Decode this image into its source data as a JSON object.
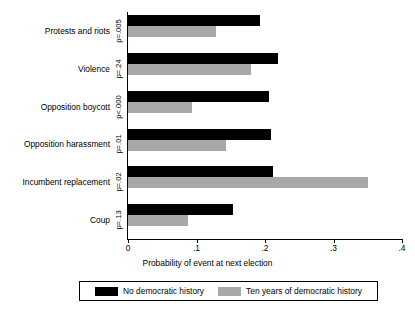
{
  "chart_data": {
    "type": "bar",
    "orientation": "horizontal",
    "title": "",
    "xlabel": "Probability of event at next election",
    "ylabel": "",
    "xlim": [
      0,
      0.4
    ],
    "xticks": [
      "0",
      ".1",
      ".2",
      ".3",
      ".4"
    ],
    "xtick_values": [
      0,
      0.1,
      0.2,
      0.3,
      0.4
    ],
    "grid": false,
    "legend_position": "bottom",
    "categories": [
      "Protests and riots",
      "Violence",
      "Opposition boycott",
      "Opposition harassment",
      "Incumbent replacement",
      "Coup"
    ],
    "annotations": [
      "p=.005",
      "p=.24",
      "p<.000",
      "p=.01",
      "p=.02",
      "p=.13"
    ],
    "series": [
      {
        "name": "No democratic history",
        "color": "#000000",
        "values": [
          0.193,
          0.219,
          0.206,
          0.209,
          0.212,
          0.154
        ]
      },
      {
        "name": "Ten years of democratic history",
        "color": "#a8a8a8",
        "values": [
          0.128,
          0.18,
          0.094,
          0.143,
          0.351,
          0.088
        ]
      }
    ]
  },
  "legend": {
    "entries": [
      {
        "label": "No democratic history",
        "swatch": "black-swatch"
      },
      {
        "label": "Ten years of democratic history",
        "swatch": "gray-swatch"
      }
    ]
  }
}
